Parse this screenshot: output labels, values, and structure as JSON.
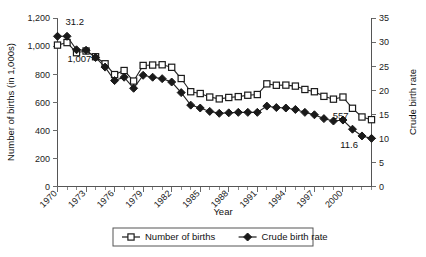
{
  "chart_data": {
    "type": "line",
    "title": "",
    "subtitle": "",
    "xlabel": "Year",
    "ylabel": "Number of births (in 1,000s)",
    "y2label": "Crude birth rate",
    "grid": false,
    "legend_position": "bottom",
    "xlim": [
      1970,
      2003
    ],
    "ylim": [
      0,
      1200
    ],
    "y2lim": [
      0,
      35
    ],
    "x": [
      1970,
      1971,
      1972,
      1973,
      1974,
      1975,
      1976,
      1977,
      1978,
      1979,
      1980,
      1981,
      1982,
      1983,
      1984,
      1985,
      1986,
      1987,
      1988,
      1989,
      1990,
      1991,
      1992,
      1993,
      1994,
      1995,
      1996,
      1997,
      1998,
      1999,
      2000,
      2001,
      2002,
      2003
    ],
    "xtick_labels": [
      "1970",
      "1973",
      "1976",
      "1979",
      "1982",
      "1985",
      "1988",
      "1991",
      "1994",
      "1997",
      "2000"
    ],
    "xtick_values": [
      1970,
      1973,
      1976,
      1979,
      1982,
      1985,
      1988,
      1991,
      1994,
      1997,
      2000
    ],
    "ytick_labels": [
      "0",
      "200",
      "400",
      "600",
      "800",
      "1,000",
      "1,200"
    ],
    "ytick_values": [
      0,
      200,
      400,
      600,
      800,
      1000,
      1200
    ],
    "y2tick_labels": [
      "0",
      "5",
      "10",
      "15",
      "20",
      "25",
      "30",
      "35"
    ],
    "y2tick_values": [
      0,
      5,
      10,
      15,
      20,
      25,
      30,
      35
    ],
    "series": [
      {
        "name": "Number of births",
        "axis": "left",
        "marker": "open-square",
        "values": [
          1007,
          1025,
          953,
          965,
          924,
          874,
          797,
          826,
          751,
          862,
          865,
          867,
          849,
          769,
          675,
          662,
          637,
          624,
          634,
          640,
          650,
          655,
          731,
          721,
          722,
          715,
          691,
          675,
          642,
          622,
          637,
          557,
          495,
          476
        ]
      },
      {
        "name": "Crude birth rate",
        "axis": "right",
        "marker": "filled-diamond",
        "values": [
          31.2,
          31.2,
          28.4,
          28.3,
          26.8,
          24.8,
          22.0,
          22.7,
          20.4,
          23.1,
          22.7,
          22.4,
          21.7,
          19.5,
          16.9,
          16.3,
          15.6,
          15.2,
          15.3,
          15.4,
          15.4,
          15.4,
          16.7,
          16.4,
          16.3,
          16.0,
          15.4,
          14.9,
          14.1,
          13.6,
          13.8,
          11.9,
          10.5,
          10.0
        ]
      }
    ],
    "annotations": [
      {
        "text": "31.2",
        "series": "Crude birth rate",
        "x": 1970
      },
      {
        "text": "1,007",
        "series": "Number of births",
        "x": 1970
      },
      {
        "text": "557",
        "series": "Number of births",
        "x": 2001
      },
      {
        "text": "11.6",
        "series": "Crude birth rate",
        "x": 2002
      }
    ]
  },
  "legend": {
    "items": [
      {
        "label": "Number of births",
        "marker": "open-square"
      },
      {
        "label": "Crude birth rate",
        "marker": "filled-diamond"
      }
    ]
  }
}
